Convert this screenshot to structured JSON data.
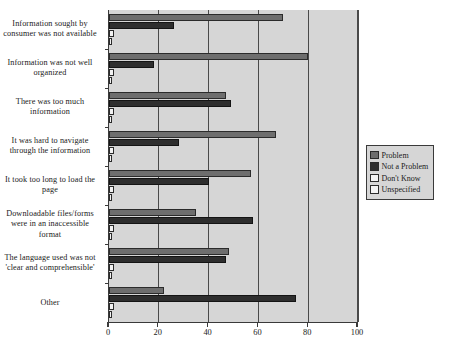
{
  "chart_data": {
    "type": "bar",
    "orientation": "horizontal",
    "title": "",
    "xlabel": "",
    "ylabel": "",
    "xlim": [
      0,
      100
    ],
    "xticks": [
      0,
      20,
      40,
      60,
      80,
      100
    ],
    "grid": true,
    "legend_position": "right",
    "categories": [
      "Information sought by consumer was not available",
      "Information was not well organized",
      "There was too much information",
      "It was hard to navigate through the information",
      "It took too long to load the page",
      "Downloadable files/forms were in an inaccessible format",
      "The language used was not 'clear and comprehensible'",
      "Other"
    ],
    "series": [
      {
        "name": "Problem",
        "color": "#6e6e6e",
        "values": [
          70,
          80,
          47,
          67,
          57,
          35,
          48,
          22
        ]
      },
      {
        "name": "Not a Problem",
        "color": "#2e2e2e",
        "values": [
          26,
          18,
          49,
          28,
          40,
          58,
          47,
          75
        ]
      },
      {
        "name": "Don't Know",
        "color": "#f2f2f2",
        "values": [
          2,
          2,
          2,
          2,
          2,
          2,
          2,
          2
        ]
      },
      {
        "name": "Unspecified",
        "color": "#f2f2f2",
        "values": [
          0.6,
          0.6,
          0.6,
          0.6,
          0.6,
          0.6,
          0.6,
          0.6
        ]
      }
    ]
  },
  "legend": {
    "items": [
      {
        "label": "Problem",
        "color": "#6e6e6e"
      },
      {
        "label": "Not a Problem",
        "color": "#2e2e2e"
      },
      {
        "label": "Don't Know",
        "color": "#f2f2f2"
      },
      {
        "label": "Unspecified",
        "color": "#f2f2f2"
      }
    ]
  },
  "axis": {
    "x_tick_labels": [
      "0",
      "20",
      "40",
      "60",
      "80",
      "100"
    ]
  }
}
